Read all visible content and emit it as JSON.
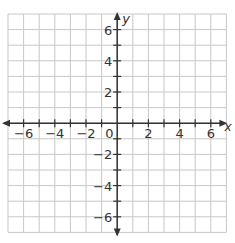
{
  "chart_data": {
    "type": "scatter",
    "title": "",
    "xlabel": "x",
    "ylabel": "y",
    "xlim": [
      -7,
      7
    ],
    "ylim": [
      -7,
      7
    ],
    "grid": true,
    "grid_step": 1,
    "x_ticks": [
      -6,
      -4,
      -2,
      0,
      2,
      4,
      6
    ],
    "y_ticks": [
      -6,
      -4,
      -2,
      2,
      4,
      6
    ],
    "x_tick_labels": [
      "−6",
      "−4",
      "−2",
      "0",
      "2",
      "4",
      "6"
    ],
    "y_tick_labels": [
      "−6",
      "−4",
      "−2",
      "2",
      "4",
      "6"
    ],
    "origin_label": "0",
    "series": [],
    "legend": null
  },
  "axes": {
    "x_label": "x",
    "y_label": "y",
    "origin": "0"
  },
  "colors": {
    "grid": "#c8c8c8",
    "axis": "#333333",
    "text": "#333333",
    "background": "#ffffff"
  }
}
